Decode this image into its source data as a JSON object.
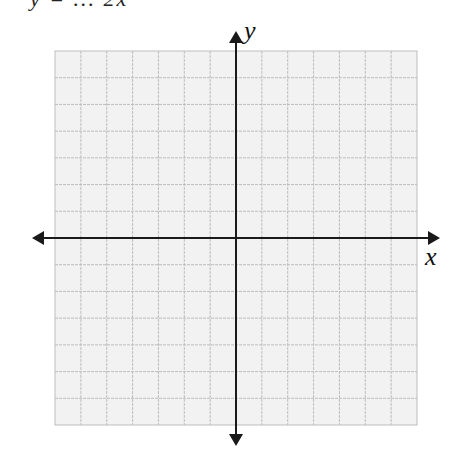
{
  "header": {
    "cropped_equation_fragment": "y = ... 2x"
  },
  "graph": {
    "x_axis_label": "x",
    "y_axis_label": "y",
    "grid": {
      "columns": 14,
      "rows": 14,
      "left": 55,
      "top": 51,
      "right": 417,
      "bottom": 425,
      "fill_color": "#f2f2f2",
      "line_color": "#bdbdbd"
    },
    "axes": {
      "x_axis_y": 238,
      "y_axis_x": 236,
      "color": "#1a1a1a",
      "x_range_px": [
        32,
        440
      ],
      "y_range_px": [
        31,
        446
      ]
    }
  }
}
